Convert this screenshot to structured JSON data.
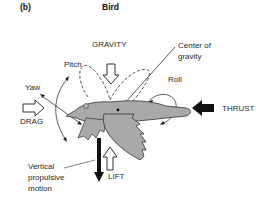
{
  "figure": {
    "panel_label": "(b)",
    "title": "Bird"
  },
  "labels": {
    "gravity": "GRAVITY",
    "center_of_gravity_line1": "Center of",
    "center_of_gravity_line2": "gravity",
    "pitch": "Pitch",
    "roll": "Roll",
    "yaw": "Yaw",
    "drag": "DRAG",
    "thrust": "THRUST",
    "lift": "LIFT",
    "vertical_line1": "Vertical",
    "vertical_line2": "propulsive",
    "vertical_line3": "motion"
  },
  "colors": {
    "bird_fill": "#a9a9a9",
    "outline": "#333333",
    "arrow_solid": "#111111"
  }
}
